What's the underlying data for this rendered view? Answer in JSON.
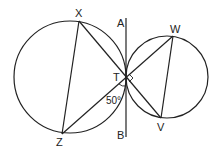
{
  "diagram": {
    "labels": {
      "X": "X",
      "A": "A",
      "W": "W",
      "T": "T",
      "Z": "Z",
      "B": "B",
      "V": "V",
      "angle": "50°"
    },
    "points": {
      "X": [
        79,
        21
      ],
      "Z": [
        62,
        134
      ],
      "T": [
        126,
        77
      ],
      "W": [
        173,
        36
      ],
      "V": [
        161,
        118
      ],
      "A": [
        126,
        18
      ],
      "B": [
        126,
        137
      ]
    },
    "circles": [
      {
        "name": "left-circle",
        "cx": 70,
        "cy": 77,
        "r": 56
      },
      {
        "name": "right-circle",
        "cx": 167,
        "cy": 77,
        "r": 41
      }
    ],
    "segments": [
      [
        "X",
        "Z"
      ],
      [
        "X",
        "V"
      ],
      [
        "Z",
        "W"
      ],
      [
        "W",
        "V"
      ],
      [
        "A",
        "B"
      ]
    ],
    "right_angle_at": "T",
    "angle_marked": {
      "vertex": "T",
      "value": "50°"
    }
  }
}
